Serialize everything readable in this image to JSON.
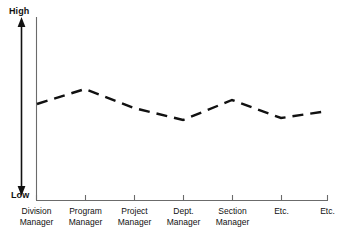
{
  "chart_data": {
    "type": "line",
    "title": "",
    "xlabel": "",
    "ylabel": "",
    "ylim": [
      0,
      100
    ],
    "y_axis_ticks": [
      "Low",
      "High"
    ],
    "grid": false,
    "legend": null,
    "line_style": "dashed",
    "line_color": "#111111",
    "categories": [
      "Division Manager",
      "Program Manager",
      "Project Manager",
      "Dept. Manager",
      "Section Manager",
      "Etc.",
      "Etc."
    ],
    "values": [
      51,
      61,
      44,
      41,
      53,
      43,
      47
    ],
    "annotations": []
  },
  "axis": {
    "high_label": "High",
    "low_label": "Low",
    "arrow_name": "vertical-double-arrow"
  },
  "ticks": [
    {
      "lines": [
        "Division",
        "Manager"
      ]
    },
    {
      "lines": [
        "Program",
        "Manager"
      ]
    },
    {
      "lines": [
        "Project",
        "Manager"
      ]
    },
    {
      "lines": [
        "Dept.",
        "Manager"
      ]
    },
    {
      "lines": [
        "Section",
        "Manager"
      ]
    },
    {
      "lines": [
        "Etc."
      ]
    },
    {
      "lines": [
        "Etc."
      ]
    }
  ],
  "colors": {
    "line": "#111111",
    "axis": "#555555",
    "text": "#111111",
    "background": "#ffffff"
  }
}
